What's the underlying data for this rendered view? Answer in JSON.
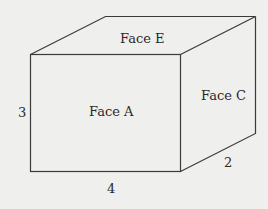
{
  "diagram": {
    "type": "rectangular-prism",
    "faces": {
      "top": "Face E",
      "front": "Face A",
      "right": "Face C"
    },
    "dimensions": {
      "height": "3",
      "width": "4",
      "depth": "2"
    },
    "colors": {
      "background": "#efefed",
      "stroke": "#3a3a3a",
      "text": "#2a2a2a"
    }
  }
}
